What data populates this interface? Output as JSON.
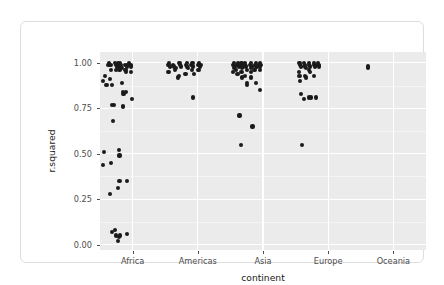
{
  "chart_data": {
    "type": "scatter",
    "title": "",
    "xlabel": "continent",
    "ylabel": "r.squared",
    "categories": [
      "Africa",
      "Americas",
      "Asia",
      "Europe",
      "Oceania"
    ],
    "ylim": [
      -0.03,
      1.06
    ],
    "ytick_values": [
      0.0,
      0.25,
      0.5,
      0.75,
      1.0
    ],
    "ytick_labels": [
      "0.00",
      "0.25",
      "0.50",
      "0.75",
      "1.00"
    ],
    "grid": "major-and-minor-white-on-grey",
    "legend": "none",
    "panel_background": "#ebebeb",
    "point_color": "#1a1a1a",
    "points": [
      {
        "continent": "Africa",
        "jitter": -0.46,
        "r.squared": 0.9
      },
      {
        "continent": "Africa",
        "jitter": -0.42,
        "r.squared": 0.93
      },
      {
        "continent": "Africa",
        "jitter": -0.4,
        "r.squared": 0.88
      },
      {
        "continent": "Africa",
        "jitter": -0.44,
        "r.squared": 0.51
      },
      {
        "continent": "Africa",
        "jitter": -0.45,
        "r.squared": 0.44
      },
      {
        "continent": "Africa",
        "jitter": -0.37,
        "r.squared": 0.99
      },
      {
        "continent": "Africa",
        "jitter": -0.36,
        "r.squared": 1.0
      },
      {
        "continent": "Africa",
        "jitter": -0.34,
        "r.squared": 0.99
      },
      {
        "continent": "Africa",
        "jitter": -0.33,
        "r.squared": 0.96
      },
      {
        "continent": "Africa",
        "jitter": -0.35,
        "r.squared": 0.91
      },
      {
        "continent": "Africa",
        "jitter": -0.32,
        "r.squared": 0.88
      },
      {
        "continent": "Africa",
        "jitter": -0.31,
        "r.squared": 0.77
      },
      {
        "continent": "Africa",
        "jitter": -0.3,
        "r.squared": 0.68
      },
      {
        "continent": "Africa",
        "jitter": -0.33,
        "r.squared": 0.45
      },
      {
        "continent": "Africa",
        "jitter": -0.35,
        "r.squared": 0.28
      },
      {
        "continent": "Africa",
        "jitter": -0.31,
        "r.squared": 0.07
      },
      {
        "continent": "Africa",
        "jitter": -0.27,
        "r.squared": 1.0
      },
      {
        "continent": "Africa",
        "jitter": -0.26,
        "r.squared": 0.99
      },
      {
        "continent": "Africa",
        "jitter": -0.24,
        "r.squared": 0.98
      },
      {
        "continent": "Africa",
        "jitter": -0.23,
        "r.squared": 0.99
      },
      {
        "continent": "Africa",
        "jitter": -0.25,
        "r.squared": 0.96
      },
      {
        "continent": "Africa",
        "jitter": -0.28,
        "r.squared": 0.77
      },
      {
        "continent": "Africa",
        "jitter": -0.27,
        "r.squared": 0.08
      },
      {
        "continent": "Africa",
        "jitter": -0.25,
        "r.squared": 0.05
      },
      {
        "continent": "Africa",
        "jitter": -0.22,
        "r.squared": 1.0
      },
      {
        "continent": "Africa",
        "jitter": -0.21,
        "r.squared": 0.99
      },
      {
        "continent": "Africa",
        "jitter": -0.2,
        "r.squared": 0.98
      },
      {
        "continent": "Africa",
        "jitter": -0.19,
        "r.squared": 1.0
      },
      {
        "continent": "Africa",
        "jitter": -0.18,
        "r.squared": 0.99
      },
      {
        "continent": "Africa",
        "jitter": -0.17,
        "r.squared": 0.97
      },
      {
        "continent": "Africa",
        "jitter": -0.2,
        "r.squared": 0.96
      },
      {
        "continent": "Africa",
        "jitter": -0.21,
        "r.squared": 0.52
      },
      {
        "continent": "Africa",
        "jitter": -0.2,
        "r.squared": 0.49
      },
      {
        "continent": "Africa",
        "jitter": -0.22,
        "r.squared": 0.31
      },
      {
        "continent": "Africa",
        "jitter": -0.2,
        "r.squared": 0.35
      },
      {
        "continent": "Africa",
        "jitter": -0.21,
        "r.squared": 0.04
      },
      {
        "continent": "Africa",
        "jitter": -0.22,
        "r.squared": 0.02
      },
      {
        "continent": "Africa",
        "jitter": -0.19,
        "r.squared": 0.05
      },
      {
        "continent": "Africa",
        "jitter": -0.16,
        "r.squared": 0.89
      },
      {
        "continent": "Africa",
        "jitter": -0.15,
        "r.squared": 0.84
      },
      {
        "continent": "Africa",
        "jitter": -0.14,
        "r.squared": 0.83
      },
      {
        "continent": "Africa",
        "jitter": -0.15,
        "r.squared": 0.76
      },
      {
        "continent": "Africa",
        "jitter": -0.12,
        "r.squared": 0.99
      },
      {
        "continent": "Africa",
        "jitter": -0.11,
        "r.squared": 0.96
      },
      {
        "continent": "Africa",
        "jitter": -0.1,
        "r.squared": 0.95
      },
      {
        "continent": "Africa",
        "jitter": -0.09,
        "r.squared": 0.98
      },
      {
        "continent": "Africa",
        "jitter": -0.08,
        "r.squared": 0.99
      },
      {
        "continent": "Africa",
        "jitter": -0.1,
        "r.squared": 0.84
      },
      {
        "continent": "Africa",
        "jitter": -0.09,
        "r.squared": 0.35
      },
      {
        "continent": "Africa",
        "jitter": -0.08,
        "r.squared": 0.06
      },
      {
        "continent": "Africa",
        "jitter": -0.05,
        "r.squared": 1.0
      },
      {
        "continent": "Africa",
        "jitter": -0.04,
        "r.squared": 0.99
      },
      {
        "continent": "Africa",
        "jitter": -0.03,
        "r.squared": 0.98
      },
      {
        "continent": "Africa",
        "jitter": -0.02,
        "r.squared": 0.99
      },
      {
        "continent": "Africa",
        "jitter": -0.03,
        "r.squared": 0.95
      },
      {
        "continent": "Africa",
        "jitter": -0.01,
        "r.squared": 0.8
      },
      {
        "continent": "Americas",
        "jitter": -0.46,
        "r.squared": 0.99
      },
      {
        "continent": "Americas",
        "jitter": -0.44,
        "r.squared": 1.0
      },
      {
        "continent": "Americas",
        "jitter": -0.43,
        "r.squared": 0.98
      },
      {
        "continent": "Americas",
        "jitter": -0.45,
        "r.squared": 0.95
      },
      {
        "continent": "Americas",
        "jitter": -0.38,
        "r.squared": 0.99
      },
      {
        "continent": "Americas",
        "jitter": -0.36,
        "r.squared": 0.98
      },
      {
        "continent": "Americas",
        "jitter": -0.34,
        "r.squared": 0.97
      },
      {
        "continent": "Americas",
        "jitter": -0.35,
        "r.squared": 0.96
      },
      {
        "continent": "Americas",
        "jitter": -0.28,
        "r.squared": 1.0
      },
      {
        "continent": "Americas",
        "jitter": -0.27,
        "r.squared": 0.99
      },
      {
        "continent": "Americas",
        "jitter": -0.26,
        "r.squared": 0.98
      },
      {
        "continent": "Americas",
        "jitter": -0.29,
        "r.squared": 0.93
      },
      {
        "continent": "Americas",
        "jitter": -0.3,
        "r.squared": 0.92
      },
      {
        "continent": "Americas",
        "jitter": -0.18,
        "r.squared": 0.99
      },
      {
        "continent": "Americas",
        "jitter": -0.17,
        "r.squared": 0.98
      },
      {
        "continent": "Americas",
        "jitter": -0.16,
        "r.squared": 1.0
      },
      {
        "continent": "Americas",
        "jitter": -0.15,
        "r.squared": 0.97
      },
      {
        "continent": "Americas",
        "jitter": -0.19,
        "r.squared": 0.94
      },
      {
        "continent": "Americas",
        "jitter": -0.1,
        "r.squared": 0.99
      },
      {
        "continent": "Americas",
        "jitter": -0.08,
        "r.squared": 1.0
      },
      {
        "continent": "Americas",
        "jitter": -0.07,
        "r.squared": 0.98
      },
      {
        "continent": "Americas",
        "jitter": -0.09,
        "r.squared": 0.96
      },
      {
        "continent": "Americas",
        "jitter": -0.06,
        "r.squared": 0.94
      },
      {
        "continent": "Americas",
        "jitter": -0.07,
        "r.squared": 0.81
      },
      {
        "continent": "Americas",
        "jitter": 0.0,
        "r.squared": 0.99
      },
      {
        "continent": "Americas",
        "jitter": 0.02,
        "r.squared": 1.0
      },
      {
        "continent": "Americas",
        "jitter": 0.03,
        "r.squared": 0.98
      },
      {
        "continent": "Americas",
        "jitter": 0.01,
        "r.squared": 0.96
      },
      {
        "continent": "Americas",
        "jitter": 0.04,
        "r.squared": 0.99
      },
      {
        "continent": "Asia",
        "jitter": -0.46,
        "r.squared": 0.99
      },
      {
        "continent": "Asia",
        "jitter": -0.45,
        "r.squared": 0.97
      },
      {
        "continent": "Asia",
        "jitter": -0.44,
        "r.squared": 1.0
      },
      {
        "continent": "Asia",
        "jitter": -0.43,
        "r.squared": 0.98
      },
      {
        "continent": "Asia",
        "jitter": -0.46,
        "r.squared": 0.95
      },
      {
        "continent": "Asia",
        "jitter": -0.42,
        "r.squared": 0.96
      },
      {
        "continent": "Asia",
        "jitter": -0.4,
        "r.squared": 0.99
      },
      {
        "continent": "Asia",
        "jitter": -0.38,
        "r.squared": 1.0
      },
      {
        "continent": "Asia",
        "jitter": -0.37,
        "r.squared": 0.98
      },
      {
        "continent": "Asia",
        "jitter": -0.39,
        "r.squared": 0.94
      },
      {
        "continent": "Asia",
        "jitter": -0.36,
        "r.squared": 0.71
      },
      {
        "continent": "Asia",
        "jitter": -0.34,
        "r.squared": 0.99
      },
      {
        "continent": "Asia",
        "jitter": -0.33,
        "r.squared": 1.0
      },
      {
        "continent": "Asia",
        "jitter": -0.32,
        "r.squared": 0.97
      },
      {
        "continent": "Asia",
        "jitter": -0.31,
        "r.squared": 0.98
      },
      {
        "continent": "Asia",
        "jitter": -0.33,
        "r.squared": 0.95
      },
      {
        "continent": "Asia",
        "jitter": -0.32,
        "r.squared": 0.92
      },
      {
        "continent": "Asia",
        "jitter": -0.34,
        "r.squared": 0.55
      },
      {
        "continent": "Asia",
        "jitter": -0.28,
        "r.squared": 0.99
      },
      {
        "continent": "Asia",
        "jitter": -0.27,
        "r.squared": 1.0
      },
      {
        "continent": "Asia",
        "jitter": -0.26,
        "r.squared": 0.98
      },
      {
        "continent": "Asia",
        "jitter": -0.25,
        "r.squared": 0.96
      },
      {
        "continent": "Asia",
        "jitter": -0.27,
        "r.squared": 0.93
      },
      {
        "continent": "Asia",
        "jitter": -0.24,
        "r.squared": 0.89
      },
      {
        "continent": "Asia",
        "jitter": -0.25,
        "r.squared": 0.88
      },
      {
        "continent": "Asia",
        "jitter": -0.2,
        "r.squared": 0.99
      },
      {
        "continent": "Asia",
        "jitter": -0.19,
        "r.squared": 1.0
      },
      {
        "continent": "Asia",
        "jitter": -0.18,
        "r.squared": 0.97
      },
      {
        "continent": "Asia",
        "jitter": -0.17,
        "r.squared": 0.98
      },
      {
        "continent": "Asia",
        "jitter": -0.19,
        "r.squared": 0.95
      },
      {
        "continent": "Asia",
        "jitter": -0.18,
        "r.squared": 0.92
      },
      {
        "continent": "Asia",
        "jitter": -0.16,
        "r.squared": 0.65
      },
      {
        "continent": "Asia",
        "jitter": -0.12,
        "r.squared": 0.99
      },
      {
        "continent": "Asia",
        "jitter": -0.11,
        "r.squared": 1.0
      },
      {
        "continent": "Asia",
        "jitter": -0.1,
        "r.squared": 0.98
      },
      {
        "continent": "Asia",
        "jitter": -0.13,
        "r.squared": 0.96
      },
      {
        "continent": "Asia",
        "jitter": -0.11,
        "r.squared": 0.89
      },
      {
        "continent": "Asia",
        "jitter": -0.06,
        "r.squared": 0.99
      },
      {
        "continent": "Asia",
        "jitter": -0.05,
        "r.squared": 1.0
      },
      {
        "continent": "Asia",
        "jitter": -0.04,
        "r.squared": 0.98
      },
      {
        "continent": "Asia",
        "jitter": -0.03,
        "r.squared": 0.99
      },
      {
        "continent": "Asia",
        "jitter": -0.05,
        "r.squared": 0.96
      },
      {
        "continent": "Asia",
        "jitter": -0.04,
        "r.squared": 0.85
      },
      {
        "continent": "Europe",
        "jitter": -0.44,
        "r.squared": 1.0
      },
      {
        "continent": "Europe",
        "jitter": -0.43,
        "r.squared": 0.99
      },
      {
        "continent": "Europe",
        "jitter": -0.42,
        "r.squared": 0.98
      },
      {
        "continent": "Europe",
        "jitter": -0.45,
        "r.squared": 0.95
      },
      {
        "continent": "Europe",
        "jitter": -0.44,
        "r.squared": 0.93
      },
      {
        "continent": "Europe",
        "jitter": -0.43,
        "r.squared": 0.9
      },
      {
        "continent": "Europe",
        "jitter": -0.42,
        "r.squared": 0.83
      },
      {
        "continent": "Europe",
        "jitter": -0.4,
        "r.squared": 0.55
      },
      {
        "continent": "Europe",
        "jitter": -0.37,
        "r.squared": 1.0
      },
      {
        "continent": "Europe",
        "jitter": -0.36,
        "r.squared": 0.99
      },
      {
        "continent": "Europe",
        "jitter": -0.35,
        "r.squared": 0.98
      },
      {
        "continent": "Europe",
        "jitter": -0.34,
        "r.squared": 0.97
      },
      {
        "continent": "Europe",
        "jitter": -0.36,
        "r.squared": 0.93
      },
      {
        "continent": "Europe",
        "jitter": -0.34,
        "r.squared": 0.92
      },
      {
        "continent": "Europe",
        "jitter": -0.37,
        "r.squared": 0.8
      },
      {
        "continent": "Europe",
        "jitter": -0.3,
        "r.squared": 0.99
      },
      {
        "continent": "Europe",
        "jitter": -0.29,
        "r.squared": 1.0
      },
      {
        "continent": "Europe",
        "jitter": -0.28,
        "r.squared": 0.98
      },
      {
        "continent": "Europe",
        "jitter": -0.3,
        "r.squared": 0.96
      },
      {
        "continent": "Europe",
        "jitter": -0.28,
        "r.squared": 0.95
      },
      {
        "continent": "Europe",
        "jitter": -0.29,
        "r.squared": 0.81
      },
      {
        "continent": "Europe",
        "jitter": -0.27,
        "r.squared": 0.81
      },
      {
        "continent": "Europe",
        "jitter": -0.22,
        "r.squared": 1.0
      },
      {
        "continent": "Europe",
        "jitter": -0.21,
        "r.squared": 0.99
      },
      {
        "continent": "Europe",
        "jitter": -0.2,
        "r.squared": 0.98
      },
      {
        "continent": "Europe",
        "jitter": -0.22,
        "r.squared": 0.93
      },
      {
        "continent": "Europe",
        "jitter": -0.19,
        "r.squared": 0.81
      },
      {
        "continent": "Europe",
        "jitter": -0.16,
        "r.squared": 1.0
      },
      {
        "continent": "Europe",
        "jitter": -0.15,
        "r.squared": 0.99
      },
      {
        "continent": "Europe",
        "jitter": -0.14,
        "r.squared": 0.98
      },
      {
        "continent": "Oceania",
        "jitter": -0.39,
        "r.squared": 0.98
      },
      {
        "continent": "Oceania",
        "jitter": -0.39,
        "r.squared": 0.97
      }
    ]
  },
  "axes": {
    "x_title": "continent",
    "y_title": "r.squared"
  }
}
